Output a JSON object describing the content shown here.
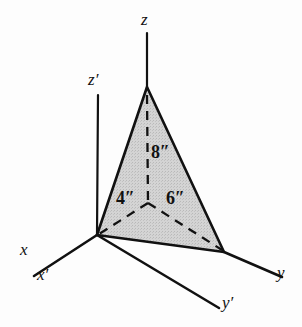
{
  "figure": {
    "background_color": "#fdfdfd",
    "stroke_color": "#111111",
    "fill_color": "#cfcfcf",
    "axes": [
      {
        "id": "z",
        "label": "z",
        "prime": false,
        "description": "vertical z axis"
      },
      {
        "id": "zp",
        "label": "z",
        "prime": true,
        "description": "vertical z-prime axis"
      },
      {
        "id": "x",
        "label": "x",
        "prime": false,
        "description": "x axis toward lower left"
      },
      {
        "id": "xp",
        "label": "x",
        "prime": true,
        "description": "x-prime axis toward lower left"
      },
      {
        "id": "y",
        "label": "y",
        "prime": false,
        "description": "y axis toward lower right"
      },
      {
        "id": "yp",
        "label": "y",
        "prime": true,
        "description": "y-prime axis toward lower right"
      }
    ],
    "dimensions": [
      {
        "id": "height",
        "label": "8″",
        "value": 8,
        "unit": "inches",
        "description": "vertical distance from intersection point up to apex on z axis"
      },
      {
        "id": "x-intercept",
        "label": "4″",
        "value": 4,
        "unit": "inches",
        "description": "distance from intersection point to origin along x direction"
      },
      {
        "id": "y-intercept",
        "label": "6″",
        "value": 6,
        "unit": "inches",
        "description": "distance from intersection point to the y axis vertex"
      }
    ],
    "labels": {
      "z": "z",
      "z_prime": "z",
      "x": "x",
      "x_prime": "x",
      "y": "y",
      "y_prime": "y",
      "prime_mark": "′",
      "dim_height": "8″",
      "dim_x": "4″",
      "dim_y": "6″"
    },
    "geometry": {
      "origin": [
        97,
        235
      ],
      "apex": [
        147,
        87
      ],
      "right_vertex": [
        224,
        252
      ],
      "inner_junction": [
        148,
        203
      ],
      "z_axis_top": [
        147,
        33
      ],
      "zprime_top": [
        98,
        95
      ],
      "x_end": [
        34,
        276
      ],
      "y_end": [
        282,
        276
      ],
      "yprime_end": [
        218,
        307
      ]
    }
  }
}
